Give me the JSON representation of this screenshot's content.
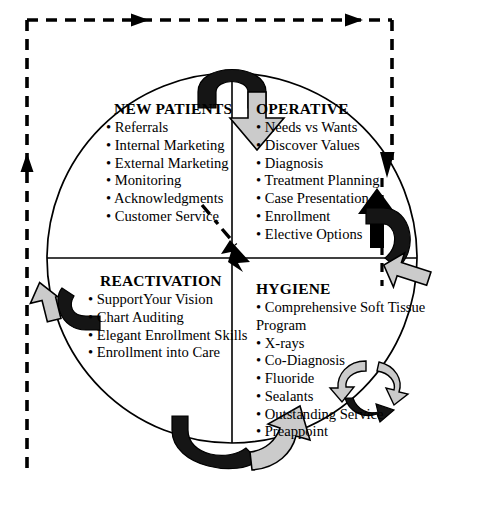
{
  "diagram": {
    "title_text": "",
    "colors": {
      "stroke": "#000000",
      "arrow_dark": "#111111",
      "arrow_light": "#c8c8c8",
      "background": "#ffffff"
    },
    "quadrants": [
      {
        "id": "new-patients",
        "title": "NEW PATIENTS",
        "items": [
          "• Referrals",
          "• Internal Marketing",
          "• External Marketing",
          "• Monitoring",
          "• Acknowledgments",
          "• Customer Service"
        ]
      },
      {
        "id": "operative",
        "title": "OPERATIVE",
        "items": [
          "• Needs vs Wants",
          "• Discover Values",
          "• Diagnosis",
          "• Treatment Planning",
          "• Case Presentation",
          "• Enrollment",
          "• Elective Options"
        ]
      },
      {
        "id": "reactivation",
        "title": "REACTIVATION",
        "items": [
          "• SupportYour Vision",
          "• Chart Auditing",
          "• Elegant Enrollment Skills",
          "• Enrollment into Care"
        ]
      },
      {
        "id": "hygiene",
        "title": "HYGIENE",
        "items": [
          "• Comprehensive Soft Tissue",
          "Program",
          "• X-rays",
          "• Co-Diagnosis",
          "• Fluoride",
          "• Sealants",
          "• Outstanding Service",
          "• Preappoint"
        ]
      }
    ],
    "icons": {
      "cycle_arrow_top": "curved-arrow-clockwise-top",
      "cycle_arrow_right": "curved-arrow-clockwise-right",
      "cycle_arrow_bottom": "curved-arrow-clockwise-bottom",
      "cycle_arrow_left": "curved-arrow-clockwise-left",
      "recycle_badge": "recycle-circular-arrows-icon",
      "feedback_arrow": "dashed-diagonal-arrow-icon",
      "frame_arrow_top": "dashed-frame-arrow-right-icon",
      "frame_arrow_left": "dashed-frame-arrow-up-icon",
      "frame_arrow_right": "dashed-frame-arrow-down-icon",
      "inner_arrow_up": "solid-arrow-up-icon"
    }
  }
}
